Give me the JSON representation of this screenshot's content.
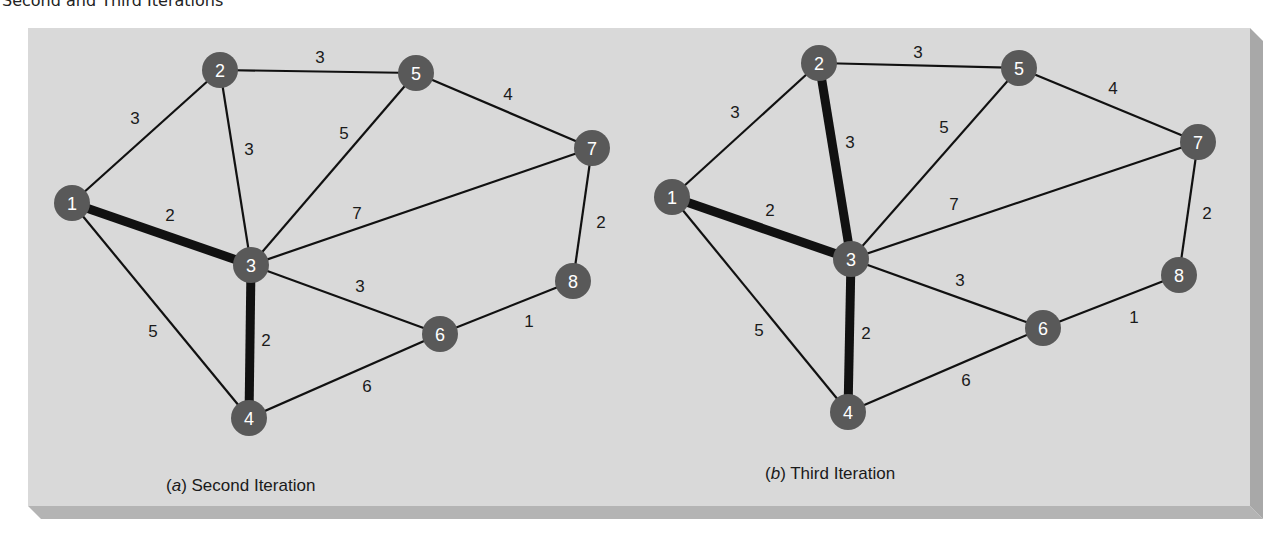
{
  "title": "Second and Third Iterations",
  "colors": {
    "panel_face": "#d9d9d9",
    "panel_side": "#a8a8a8",
    "panel_bottom": "#b4b4b4",
    "node_fill": "#595959",
    "node_text": "#ffffff",
    "edge": "#111111",
    "text": "#1a1a1a"
  },
  "panel": {
    "x": 28,
    "y": 28,
    "w": 1222,
    "h": 478,
    "depth": 13
  },
  "node_radius": 18,
  "graphs": [
    {
      "id": "a",
      "caption_letter": "a",
      "caption_text": "Second Iteration",
      "caption_pos": [
        166,
        491
      ],
      "nodes": [
        {
          "id": "1",
          "x": 72,
          "y": 203
        },
        {
          "id": "2",
          "x": 220,
          "y": 70
        },
        {
          "id": "3",
          "x": 251,
          "y": 265
        },
        {
          "id": "4",
          "x": 249,
          "y": 418
        },
        {
          "id": "5",
          "x": 416,
          "y": 73
        },
        {
          "id": "6",
          "x": 440,
          "y": 334
        },
        {
          "id": "7",
          "x": 592,
          "y": 148
        },
        {
          "id": "8",
          "x": 573,
          "y": 281
        }
      ],
      "edges": [
        {
          "from": "1",
          "to": "2",
          "weight": "3",
          "bold": false,
          "lx": 135,
          "ly": 118
        },
        {
          "from": "1",
          "to": "3",
          "weight": "2",
          "bold": true,
          "lx": 170,
          "ly": 215
        },
        {
          "from": "1",
          "to": "4",
          "weight": "5",
          "bold": false,
          "lx": 153,
          "ly": 331
        },
        {
          "from": "2",
          "to": "3",
          "weight": "3",
          "bold": false,
          "lx": 249,
          "ly": 149
        },
        {
          "from": "2",
          "to": "5",
          "weight": "3",
          "bold": false,
          "lx": 320,
          "ly": 57
        },
        {
          "from": "3",
          "to": "5",
          "weight": "5",
          "bold": false,
          "lx": 344,
          "ly": 133
        },
        {
          "from": "3",
          "to": "7",
          "weight": "7",
          "bold": false,
          "lx": 357,
          "ly": 213
        },
        {
          "from": "3",
          "to": "6",
          "weight": "3",
          "bold": false,
          "lx": 360,
          "ly": 286
        },
        {
          "from": "3",
          "to": "4",
          "weight": "2",
          "bold": true,
          "lx": 266,
          "ly": 340
        },
        {
          "from": "4",
          "to": "6",
          "weight": "6",
          "bold": false,
          "lx": 367,
          "ly": 386
        },
        {
          "from": "5",
          "to": "7",
          "weight": "4",
          "bold": false,
          "lx": 508,
          "ly": 94
        },
        {
          "from": "7",
          "to": "8",
          "weight": "2",
          "bold": false,
          "lx": 601,
          "ly": 222
        },
        {
          "from": "6",
          "to": "8",
          "weight": "1",
          "bold": false,
          "lx": 529,
          "ly": 321
        }
      ]
    },
    {
      "id": "b",
      "caption_letter": "b",
      "caption_text": "Third Iteration",
      "caption_pos": [
        765,
        479
      ],
      "nodes": [
        {
          "id": "1",
          "x": 672,
          "y": 197
        },
        {
          "id": "2",
          "x": 819,
          "y": 63
        },
        {
          "id": "3",
          "x": 851,
          "y": 259
        },
        {
          "id": "4",
          "x": 848,
          "y": 412
        },
        {
          "id": "5",
          "x": 1019,
          "y": 68
        },
        {
          "id": "6",
          "x": 1043,
          "y": 328
        },
        {
          "id": "7",
          "x": 1198,
          "y": 142
        },
        {
          "id": "8",
          "x": 1179,
          "y": 275
        }
      ],
      "edges": [
        {
          "from": "1",
          "to": "2",
          "weight": "3",
          "bold": false,
          "lx": 735,
          "ly": 112
        },
        {
          "from": "1",
          "to": "3",
          "weight": "2",
          "bold": true,
          "lx": 770,
          "ly": 210
        },
        {
          "from": "1",
          "to": "4",
          "weight": "5",
          "bold": false,
          "lx": 759,
          "ly": 330
        },
        {
          "from": "2",
          "to": "3",
          "weight": "3",
          "bold": true,
          "lx": 850,
          "ly": 142
        },
        {
          "from": "2",
          "to": "5",
          "weight": "3",
          "bold": false,
          "lx": 918,
          "ly": 52
        },
        {
          "from": "3",
          "to": "5",
          "weight": "5",
          "bold": false,
          "lx": 944,
          "ly": 127
        },
        {
          "from": "3",
          "to": "7",
          "weight": "7",
          "bold": false,
          "lx": 954,
          "ly": 204
        },
        {
          "from": "3",
          "to": "6",
          "weight": "3",
          "bold": false,
          "lx": 960,
          "ly": 280
        },
        {
          "from": "3",
          "to": "4",
          "weight": "2",
          "bold": true,
          "lx": 866,
          "ly": 333
        },
        {
          "from": "4",
          "to": "6",
          "weight": "6",
          "bold": false,
          "lx": 966,
          "ly": 380
        },
        {
          "from": "5",
          "to": "7",
          "weight": "4",
          "bold": false,
          "lx": 1113,
          "ly": 88
        },
        {
          "from": "7",
          "to": "8",
          "weight": "2",
          "bold": false,
          "lx": 1207,
          "ly": 213
        },
        {
          "from": "6",
          "to": "8",
          "weight": "1",
          "bold": false,
          "lx": 1134,
          "ly": 317
        }
      ]
    }
  ]
}
